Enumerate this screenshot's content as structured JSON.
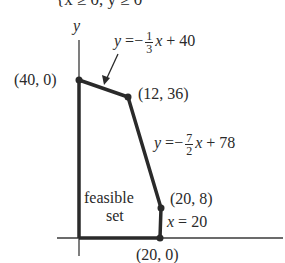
{
  "header": {
    "constraint_text_cut": "{x ≥ 0, y ≥ 0"
  },
  "axes": {
    "y_label": "y"
  },
  "vertices": [
    {
      "label": "(40, 0)",
      "px": [
        79,
        80
      ]
    },
    {
      "label": "(12, 36)",
      "px": [
        128,
        97
      ]
    },
    {
      "label": "(20, 8)",
      "px": [
        161,
        208
      ]
    },
    {
      "label": "(20, 0)",
      "px": [
        160,
        238
      ]
    }
  ],
  "lines": {
    "line1": {
      "lhs": "y",
      "eq": "=",
      "sign": "−",
      "num": "1",
      "den": "3",
      "var": "x",
      "rest": "+ 40"
    },
    "line2": {
      "lhs": "y",
      "eq": "=",
      "sign": "−",
      "num": "7",
      "den": "2",
      "var": "x",
      "rest": "+ 78"
    },
    "line3": {
      "lhs": "x",
      "rest": "= 20"
    }
  },
  "region": {
    "label_line1": "feasible",
    "label_line2": "set"
  },
  "colors": {
    "stroke": "#2a2a2a",
    "background": "#ffffff"
  }
}
